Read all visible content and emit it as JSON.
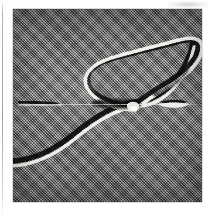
{
  "page": {
    "background_color": "#ffffff",
    "width": 214,
    "height": 216,
    "artifacts": {
      "left_scan_line": "faint vertical gray scan edge at left margin",
      "top_right_smudge": "faint light-gray smudge in upper right margin"
    }
  },
  "plate": {
    "label": "micrograph-plate",
    "x": 13,
    "y": 9,
    "width": 189,
    "height": 193,
    "background_color": "#7b7b7b",
    "texture": "diagonal halftone dither screen (coarse printed newsprint raster)",
    "border_color": "#9a9a9a",
    "tone_description": "uniform mid-gray field, slightly darker toward the edges"
  },
  "features": [
    {
      "id": "main-loop",
      "name": "elongated-loop",
      "description": "Long narrow closed loop tilted about 25 degrees from horizontal, occupying the upper middle and right of the frame. Rendered in relief: a bright white highlight along the lower/outer side of the filament and a black shadow along the upper/inner side.",
      "highlight_color": "#f6f6f2",
      "shadow_color": "#141414",
      "tilt_degrees": -25
    },
    {
      "id": "trailing-filament",
      "name": "trailing-curved-filament",
      "description": "A single curved filament sweeping from the lower-left edge of the frame upward to the right, passing through the loop crossing point and continuing to the upper-right corner of the loop.",
      "highlight_color": "#f6f6f2",
      "shadow_color": "#141414"
    },
    {
      "id": "crossing-node",
      "name": "filament-crossing-node",
      "description": "Bright knot where the loop closes and the trailing filament crosses, near the center of the frame.",
      "x": 133,
      "y": 105
    },
    {
      "id": "left-streak",
      "name": "left-dark-streak",
      "description": "Short dark horizontal streak with a thin white edge beneath it, at mid-height on the left side of the frame.",
      "x1": 20,
      "y1": 102,
      "x2": 57,
      "y2": 104
    },
    {
      "id": "right-lens",
      "name": "right-lens-speck",
      "description": "Small lens-shaped speck: dark cap above, bright white body below, at mid-height on the right side of the frame.",
      "x": 172,
      "y": 105,
      "width": 26,
      "height": 9
    }
  ],
  "caption": {
    "visible": false,
    "text": ""
  }
}
